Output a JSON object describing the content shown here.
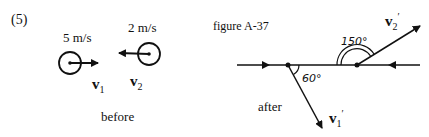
{
  "problem_number": "(5)",
  "before": {
    "caption": "before",
    "ball1": {
      "speed": "5 m/s",
      "label": "v",
      "sub": "1",
      "direction": "right"
    },
    "ball2": {
      "speed": "2 m/s",
      "label": "v",
      "sub": "2",
      "direction": "left"
    }
  },
  "after": {
    "figure_label": "figure A-37",
    "caption": "after",
    "v1_prime": {
      "label": "v",
      "sub": "1",
      "prime": "′",
      "angle": "60°"
    },
    "v2_prime": {
      "label": "v",
      "sub": "2",
      "prime": "′",
      "angle": "150°"
    }
  },
  "colors": {
    "ink": "#111111",
    "background": "#ffffff"
  }
}
